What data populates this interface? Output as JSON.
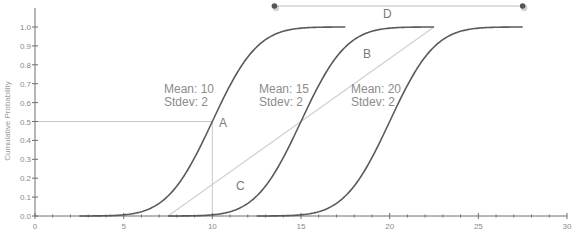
{
  "chart_data": {
    "type": "line",
    "title": "",
    "xlabel": "",
    "ylabel": "Cumulative Probability",
    "xlim": [
      0,
      30
    ],
    "ylim": [
      0,
      1.0
    ],
    "grid": false,
    "x_ticks": [
      0,
      5,
      10,
      15,
      20,
      25,
      30
    ],
    "x_tick_labels": [
      "0",
      "5",
      "10",
      "15",
      "20",
      "25",
      "30"
    ],
    "y_ticks": [
      0.0,
      0.1,
      0.2,
      0.3,
      0.4,
      0.5,
      0.6,
      0.7,
      0.8,
      0.9,
      1.0
    ],
    "y_tick_labels": [
      "0.0",
      "0.1",
      "0.2",
      "0.3",
      "0.4",
      "0.5",
      "0.6",
      "0.7",
      "0.8",
      "0.9",
      "1.0"
    ],
    "series": [
      {
        "name": "Normal CDF mean 10 sd 2",
        "mean": 10,
        "stdev": 2,
        "x_range": [
          2.5,
          17.5
        ]
      },
      {
        "name": "Normal CDF mean 15 sd 2",
        "mean": 15,
        "stdev": 2,
        "x_range": [
          7.5,
          22.5
        ]
      },
      {
        "name": "Normal CDF mean 20 sd 2",
        "mean": 20,
        "stdev": 2,
        "x_range": [
          12.5,
          27.5
        ]
      }
    ],
    "reference_lines": {
      "median_horizontal": {
        "y": 0.5,
        "x_from": 0,
        "x_to": 10
      },
      "median_vertical": {
        "x": 10,
        "y_from": 0,
        "y_to": 0.5
      },
      "diagonal_C": {
        "x_from": 7.5,
        "y_from": 0.0,
        "x_to": 22.5,
        "y_to": 1.0
      },
      "range_D": {
        "x_from": 13.5,
        "x_to": 27.5,
        "y": 1.12
      }
    },
    "annotations": [
      {
        "id": "label-mean10",
        "lines": [
          "Mean: 10",
          "Stdev: 2"
        ],
        "x": 7.3,
        "y": 0.72
      },
      {
        "id": "label-mean15",
        "lines": [
          "Mean: 15",
          "Stdev: 2"
        ],
        "x": 12.5,
        "y": 0.72
      },
      {
        "id": "label-mean20",
        "lines": [
          "Mean: 20",
          "Stdev: 2"
        ],
        "x": 17.7,
        "y": 0.72
      },
      {
        "id": "letter-A",
        "text": "A",
        "x": 10.3,
        "y": 0.47
      },
      {
        "id": "letter-B",
        "text": "B",
        "x": 18.3,
        "y": 0.88
      },
      {
        "id": "letter-C",
        "text": "C",
        "x": 10.6,
        "y": 0.15
      },
      {
        "id": "letter-D",
        "text": "D",
        "x": 20.0,
        "y": 1.07
      }
    ]
  },
  "labels": {
    "ylabel": "Cumulative Probability",
    "mean10_line1": "Mean: 10",
    "mean10_line2": "Stdev: 2",
    "mean15_line1": "Mean: 15",
    "mean15_line2": "Stdev: 2",
    "mean20_line1": "Mean: 20",
    "mean20_line2": "Stdev: 2",
    "A": "A",
    "B": "B",
    "C": "C",
    "D": "D"
  }
}
